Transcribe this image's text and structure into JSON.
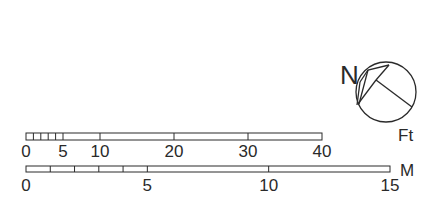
{
  "north_arrow": {
    "label": "N"
  },
  "feet_scale": {
    "unit": "Ft",
    "min": 0,
    "max": 40,
    "labels": [
      "0",
      "5",
      "10",
      "20",
      "30",
      "40"
    ],
    "label_values": [
      0,
      5,
      10,
      20,
      30,
      40
    ],
    "minor_ticks": [
      1,
      2,
      3,
      4,
      5
    ],
    "major_ticks": [
      10,
      20,
      30
    ]
  },
  "meter_scale": {
    "unit": "M",
    "min": 0,
    "max": 15,
    "labels": [
      "0",
      "5",
      "10",
      "15"
    ],
    "label_values": [
      0,
      5,
      10,
      15
    ],
    "ticks": [
      1,
      2,
      3,
      4,
      5,
      10
    ]
  },
  "colors": {
    "line": "#2a2a2a",
    "background": "#ffffff"
  }
}
